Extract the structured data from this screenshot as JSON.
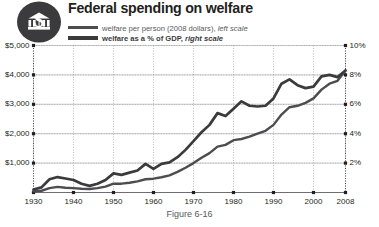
{
  "header": {
    "title": "Federal spending on welfare",
    "badge_icon": "dollar-capitol-badge-icon"
  },
  "legend": [
    {
      "label": "welfare per person (2008 dollars),",
      "scale_note": "left scale",
      "color": "#4d4d4f"
    },
    {
      "label": "welfare as a % of GDP,",
      "scale_note": "right scale",
      "color": "#3b3b3d"
    }
  ],
  "caption": "Figure 6-16",
  "chart_data": {
    "type": "line",
    "title": "Federal spending on welfare",
    "xlabel": "",
    "ylabel": "",
    "grid": true,
    "legend_position": "top",
    "x": [
      1930,
      1932,
      1934,
      1936,
      1938,
      1940,
      1942,
      1944,
      1946,
      1948,
      1950,
      1952,
      1954,
      1956,
      1958,
      1960,
      1962,
      1964,
      1966,
      1968,
      1970,
      1972,
      1974,
      1976,
      1978,
      1980,
      1982,
      1984,
      1986,
      1988,
      1990,
      1992,
      1994,
      1996,
      1998,
      2000,
      2002,
      2004,
      2006,
      2008
    ],
    "xlim": [
      1930,
      2008
    ],
    "xticks": [
      1930,
      1940,
      1950,
      1960,
      1970,
      1980,
      1990,
      2000,
      2008
    ],
    "xticklabels": [
      "1930",
      "1940",
      "1950",
      "1960",
      "1970",
      "1980",
      "1990",
      "2000",
      "2008"
    ],
    "left_axis": {
      "label": "welfare per person (2008 dollars)",
      "ylim": [
        0,
        5000
      ],
      "yticks": [
        1000,
        2000,
        3000,
        4000,
        5000
      ],
      "yticklabels": [
        "$1,000",
        "$2,000",
        "$3,000",
        "$4,000",
        "$5,000"
      ]
    },
    "right_axis": {
      "label": "welfare as a % of GDP",
      "ylim": [
        0,
        10
      ],
      "yticks": [
        2,
        4,
        6,
        8,
        10
      ],
      "yticklabels": [
        "2%",
        "4%",
        "6%",
        "8%",
        "10%"
      ]
    },
    "series": [
      {
        "name": "welfare per person (2008 dollars), left scale",
        "axis": "left",
        "color": "#4d4d4f",
        "values": [
          40,
          60,
          150,
          190,
          160,
          150,
          130,
          120,
          150,
          200,
          300,
          300,
          330,
          380,
          450,
          470,
          520,
          580,
          700,
          840,
          1000,
          1180,
          1340,
          1560,
          1620,
          1780,
          1820,
          1900,
          2000,
          2100,
          2300,
          2650,
          2900,
          2950,
          3050,
          3200,
          3500,
          3700,
          3800,
          4150
        ]
      },
      {
        "name": "welfare as a % of GDP, right scale",
        "axis": "right",
        "color": "#3b3b3d",
        "values": [
          0.2,
          0.35,
          0.9,
          1.05,
          0.95,
          0.85,
          0.6,
          0.45,
          0.6,
          0.85,
          1.3,
          1.2,
          1.35,
          1.5,
          1.95,
          1.6,
          1.95,
          2.05,
          2.4,
          2.9,
          3.5,
          4.1,
          4.6,
          5.4,
          5.2,
          5.7,
          6.2,
          5.9,
          5.85,
          5.9,
          6.4,
          7.4,
          7.7,
          7.3,
          7.1,
          7.2,
          7.9,
          8.0,
          7.85,
          8.3
        ]
      }
    ]
  }
}
